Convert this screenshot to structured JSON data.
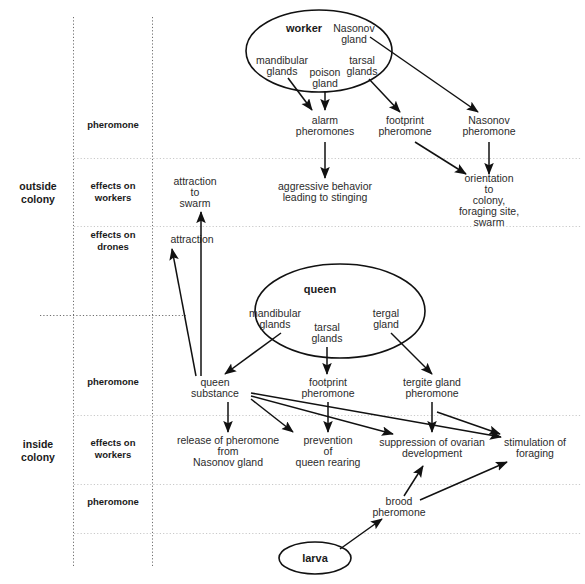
{
  "diagram": {
    "title_note": "Honey bee pheromone communication diagram",
    "sections": [
      {
        "id": "outside",
        "label": "outside\ncolony",
        "line1": "outside",
        "line2": "colony"
      },
      {
        "id": "inside",
        "label": "inside\ncolony",
        "line1": "inside",
        "line2": "colony"
      }
    ],
    "row_labels": [
      {
        "id": "row-pheromone-outside",
        "line1": "pheromone",
        "line2": ""
      },
      {
        "id": "row-effects-workers-outside",
        "line1": "effects on",
        "line2": "workers"
      },
      {
        "id": "row-effects-drones-outside",
        "line1": "effects on",
        "line2": "drones"
      },
      {
        "id": "row-pheromone-inside",
        "line1": "pheromone",
        "line2": ""
      },
      {
        "id": "row-effects-workers-inside",
        "line1": "effects on",
        "line2": "workers"
      },
      {
        "id": "row-pheromone-brood",
        "line1": "pheromone",
        "line2": ""
      }
    ],
    "castes": [
      {
        "id": "worker",
        "label": "worker"
      },
      {
        "id": "queen",
        "label": "queen"
      },
      {
        "id": "larva",
        "label": "larva"
      }
    ],
    "worker_glands": [
      {
        "id": "worker-mandibular-glands",
        "line1": "mandibular",
        "line2": "glands"
      },
      {
        "id": "worker-poison-gland",
        "line1": "poison",
        "line2": "gland"
      },
      {
        "id": "worker-tarsal-glands",
        "line1": "tarsal",
        "line2": "glands"
      },
      {
        "id": "worker-nasonov-gland",
        "line1": "Nasonov",
        "line2": "gland"
      }
    ],
    "queen_glands": [
      {
        "id": "queen-mandibular-glands",
        "line1": "mandibular",
        "line2": "glands"
      },
      {
        "id": "queen-tarsal-glands",
        "line1": "tarsal",
        "line2": "glands"
      },
      {
        "id": "queen-tergal-gland",
        "line1": "tergal",
        "line2": "gland"
      }
    ],
    "pheromones_outside": [
      {
        "id": "alarm-pheromones",
        "line1": "alarm",
        "line2": "pheromones"
      },
      {
        "id": "footprint-pheromone-outside",
        "line1": "footprint",
        "line2": "pheromone"
      },
      {
        "id": "nasonov-pheromone",
        "line1": "Nasonov",
        "line2": "pheromone"
      }
    ],
    "effects_outside": [
      {
        "id": "attraction-to-swarm",
        "line1": "attraction",
        "line2": "to",
        "line3": "swarm"
      },
      {
        "id": "aggressive-behavior",
        "line1": "aggressive behavior",
        "line2": "leading to stinging"
      },
      {
        "id": "orientation",
        "line1": "orientation",
        "line2": "to",
        "line3": "colony,",
        "line4": "foraging site,",
        "line5": "swarm"
      },
      {
        "id": "attraction-drones",
        "line1": "attraction",
        "line2": ""
      }
    ],
    "pheromones_inside": [
      {
        "id": "queen-substance",
        "line1": "queen",
        "line2": "substance"
      },
      {
        "id": "footprint-pheromone-inside",
        "line1": "footprint",
        "line2": "pheromone"
      },
      {
        "id": "tergite-gland-pheromone",
        "line1": "tergite gland",
        "line2": "pheromone"
      },
      {
        "id": "brood-pheromone",
        "line1": "brood",
        "line2": "pheromone"
      }
    ],
    "effects_inside": [
      {
        "id": "release-nasonov",
        "line1": "release of pheromone",
        "line2": "from",
        "line3": "Nasonov gland"
      },
      {
        "id": "prevention-queen-rearing",
        "line1": "prevention",
        "line2": "of",
        "line3": "queen rearing"
      },
      {
        "id": "suppression-ovarian",
        "line1": "suppression of ovarian",
        "line2": "development"
      },
      {
        "id": "stimulation-foraging",
        "line1": "stimulation of",
        "line2": "foraging"
      }
    ],
    "colors": {
      "background": "#ffffff",
      "text": "#2b2b2b",
      "label_text": "#1a1a1a",
      "stroke": "#111111",
      "grid_light": "#c9c9c9",
      "grid_dark": "#6e6e6e"
    }
  }
}
